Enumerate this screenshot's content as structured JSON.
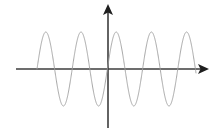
{
  "figure": {
    "kind": "cartesian-plot",
    "title": "",
    "background_color": "#ffffff",
    "width": 216,
    "height": 135
  },
  "axes": {
    "color": "#3d3d3d",
    "arrow_color": "#1f1f1f",
    "origin": {
      "x": 108,
      "y": 69
    },
    "horizontal": {
      "name": "x-axis",
      "label": "",
      "x_start": 16,
      "x_end": 201,
      "y": 69,
      "arrow_at": "right",
      "arrow_tip_x": 209,
      "ticks": [],
      "tick_labels": []
    },
    "vertical": {
      "name": "y-axis",
      "label": "",
      "y_start": 128,
      "y_end": 12,
      "x": 108,
      "arrow_at": "top",
      "arrow_tip_y": 4,
      "ticks": [],
      "tick_labels": []
    }
  },
  "chart_data": {
    "type": "line",
    "title": "",
    "subtitle": "",
    "xlabel": "",
    "ylabel": "",
    "grid": false,
    "legend": false,
    "legend_entries": [],
    "annotations": [],
    "xlim": [
      16,
      209
    ],
    "ylim": [
      -1.1,
      1.1
    ],
    "series": [
      {
        "name": "sine-wave",
        "color": "#9d9d9d",
        "stroke_width": 0.9,
        "function": "sin",
        "amplitude": 1,
        "amplitude_px": 37,
        "period_px": 35.2,
        "cycles": 4.5,
        "phase": "rises from zero at left end",
        "x_start_px": 37,
        "x_end_px": 196,
        "baseline_y_px": 69,
        "peak_y_px": 32,
        "trough_y_px": 106,
        "peaks_x_px": [
          46,
          81,
          117,
          152
        ],
        "troughs_x_px": [
          64,
          99,
          135,
          170,
          188
        ],
        "zero_crossings_x_px": [
          37,
          55,
          73,
          90,
          108,
          126,
          143,
          161,
          179,
          196
        ]
      }
    ]
  }
}
